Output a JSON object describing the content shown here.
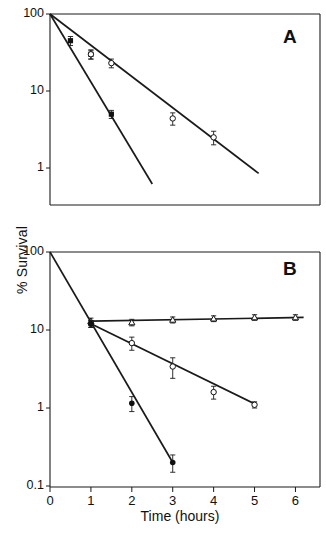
{
  "figure": {
    "axis_x_label": "Time (hours)",
    "axis_y_label": "% Survival",
    "panel_a_letter": "A",
    "panel_b_letter": "B"
  },
  "ticks": {
    "x_labels": [
      "0",
      "1",
      "2",
      "3",
      "4",
      "5",
      "6"
    ],
    "panel_a_y_labels": [
      "100",
      "10",
      "1"
    ],
    "panel_b_y_labels": [
      "100",
      "10",
      "1",
      "0.1"
    ]
  },
  "chart_data": [
    {
      "type": "line",
      "panel": "A",
      "title": "A",
      "xlabel": "Time (hours)",
      "ylabel": "% Survival",
      "yscale": "log",
      "ylim": [
        1,
        100
      ],
      "xlim": [
        0,
        6.6
      ],
      "grid": false,
      "legend": "none",
      "series": [
        {
          "name": "fast-decay-filled-square",
          "marker": "filled-square",
          "x": [
            0,
            0.5,
            1,
            1.5,
            2.5
          ],
          "y": [
            100,
            45,
            30,
            5,
            0.62
          ],
          "yerr": [
            0,
            6,
            4,
            0.6,
            0.09
          ],
          "fit_line": {
            "x": [
              0,
              2.5
            ],
            "y": [
              100,
              0.62
            ]
          }
        },
        {
          "name": "slow-decay-open-circle",
          "marker": "open-circle",
          "x": [
            0,
            1,
            1.5,
            3,
            4,
            5
          ],
          "y": [
            100,
            30,
            23,
            4.4,
            2.5,
            0.62
          ],
          "yerr": [
            0,
            4,
            3,
            0.8,
            0.5,
            0.12
          ],
          "fit_line": {
            "x": [
              0,
              5.1
            ],
            "y": [
              100,
              0.85
            ]
          }
        }
      ]
    },
    {
      "type": "line",
      "panel": "B",
      "title": "B",
      "xlabel": "Time (hours)",
      "ylabel": "% Survival",
      "yscale": "log",
      "ylim": [
        0.1,
        100
      ],
      "xlim": [
        0,
        6.6
      ],
      "grid": false,
      "legend": "none",
      "series": [
        {
          "name": "plateau-open-triangle",
          "marker": "open-triangle",
          "x": [
            1,
            2,
            3,
            4,
            5,
            6
          ],
          "y": [
            13,
            12.5,
            13.5,
            14,
            14.5,
            14.5
          ],
          "yerr": [
            1.2,
            1.2,
            1.2,
            1.2,
            1.2,
            1.2
          ],
          "fit_line": {
            "x": [
              1,
              6.2
            ],
            "y": [
              13,
              14.5
            ]
          }
        },
        {
          "name": "intermediate-decay-open-circle",
          "marker": "open-circle",
          "x": [
            1,
            2,
            3,
            4,
            5
          ],
          "y": [
            12,
            6.8,
            3.4,
            1.6,
            1.1
          ],
          "yerr": [
            1.2,
            1.3,
            1.0,
            0.3,
            0.1
          ],
          "fit_line": {
            "x": [
              1,
              5.05
            ],
            "y": [
              12,
              1.1
            ]
          }
        },
        {
          "name": "fast-decay-filled-circle",
          "marker": "filled-circle",
          "x": [
            0,
            1,
            2,
            3
          ],
          "y": [
            100,
            12,
            1.15,
            0.2
          ],
          "yerr": [
            0,
            1.2,
            0.25,
            0.05
          ],
          "fit_line": {
            "x": [
              0,
              3
            ],
            "y": [
              100,
              0.2
            ]
          }
        }
      ]
    }
  ]
}
